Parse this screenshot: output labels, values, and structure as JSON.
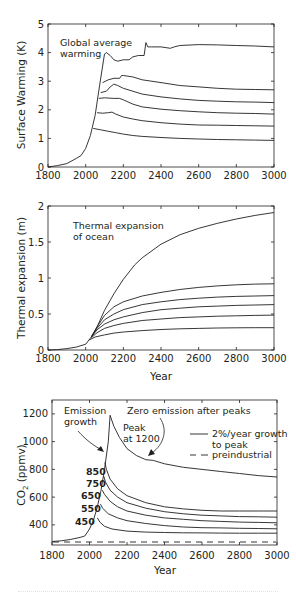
{
  "chart_data": [
    {
      "type": "line",
      "title": "",
      "annotation": [
        "Global average",
        "warming"
      ],
      "xlabel": "",
      "ylabel": "Surface Warming (K)",
      "xlim": [
        1800,
        3000
      ],
      "ylim": [
        0,
        5
      ],
      "xticks": [
        1800,
        2000,
        2200,
        2400,
        2600,
        2800,
        3000
      ],
      "yticks": [
        0,
        1,
        2,
        3,
        4,
        5
      ],
      "grid": false,
      "series": [
        {
          "name": "peak 1200",
          "x": [
            1800,
            1850,
            1900,
            1950,
            1975,
            2000,
            2025,
            2050,
            2075,
            2100,
            2110,
            2130,
            2150,
            2170,
            2200,
            2230,
            2250,
            2280,
            2310,
            2320,
            2330,
            2350,
            2400,
            2450,
            2470,
            2500,
            2600,
            2700,
            2800,
            2900,
            3000
          ],
          "y": [
            0,
            0.05,
            0.12,
            0.3,
            0.4,
            0.65,
            1.1,
            1.8,
            2.9,
            3.95,
            4.0,
            3.9,
            3.75,
            3.7,
            3.75,
            3.75,
            3.85,
            3.9,
            3.9,
            4.35,
            4.2,
            4.2,
            4.2,
            4.15,
            4.2,
            4.25,
            4.28,
            4.27,
            4.25,
            4.23,
            4.2
          ]
        },
        {
          "name": "peak 850",
          "x": [
            2090,
            2120,
            2150,
            2180,
            2190,
            2200,
            2250,
            2300,
            2400,
            2500,
            2600,
            2700,
            2800,
            2900,
            3000
          ],
          "y": [
            2.95,
            3.05,
            3.1,
            3.1,
            3.2,
            3.2,
            3.15,
            3.05,
            2.95,
            2.85,
            2.8,
            2.75,
            2.72,
            2.71,
            2.7
          ]
        },
        {
          "name": "peak 750",
          "x": [
            2080,
            2110,
            2130,
            2150,
            2170,
            2200,
            2250,
            2300,
            2400,
            2500,
            2600,
            2700,
            2800,
            2900,
            3000
          ],
          "y": [
            2.6,
            2.65,
            2.8,
            2.9,
            2.85,
            2.75,
            2.65,
            2.55,
            2.45,
            2.38,
            2.33,
            2.3,
            2.28,
            2.27,
            2.25
          ]
        },
        {
          "name": "peak 650",
          "x": [
            2070,
            2100,
            2150,
            2180,
            2200,
            2250,
            2300,
            2400,
            2500,
            2600,
            2700,
            2800,
            2900,
            3000
          ],
          "y": [
            2.4,
            2.42,
            2.4,
            2.4,
            2.35,
            2.2,
            2.1,
            2.02,
            1.97,
            1.93,
            1.9,
            1.88,
            1.87,
            1.85
          ]
        },
        {
          "name": "peak 550",
          "x": [
            2060,
            2090,
            2120,
            2140,
            2160,
            2200,
            2250,
            2300,
            2400,
            2500,
            2600,
            2700,
            2800,
            2900,
            3000
          ],
          "y": [
            1.9,
            1.88,
            1.9,
            1.92,
            1.85,
            1.75,
            1.68,
            1.62,
            1.55,
            1.5,
            1.47,
            1.46,
            1.45,
            1.44,
            1.43
          ]
        },
        {
          "name": "peak 450",
          "x": [
            2040,
            2080,
            2120,
            2160,
            2200,
            2250,
            2300,
            2400,
            2500,
            2600,
            2700,
            2800,
            2900,
            3000
          ],
          "y": [
            1.35,
            1.3,
            1.25,
            1.2,
            1.15,
            1.1,
            1.07,
            1.03,
            1.0,
            0.98,
            0.96,
            0.95,
            0.94,
            0.93
          ]
        }
      ]
    },
    {
      "type": "line",
      "title": "",
      "annotation": [
        "Thermal expansion",
        "of ocean"
      ],
      "xlabel": "Year",
      "ylabel": "Thermal expansion (m)",
      "xlim": [
        1800,
        3000
      ],
      "ylim": [
        0,
        2
      ],
      "xticks": [
        1800,
        2000,
        2200,
        2400,
        2600,
        2800,
        3000
      ],
      "yticks": [
        0,
        0.5,
        1,
        1.5,
        2
      ],
      "grid": false,
      "series": [
        {
          "name": "peak 1200",
          "x": [
            1800,
            1850,
            1900,
            1950,
            2000,
            2030,
            2060,
            2100,
            2150,
            2200,
            2260,
            2300,
            2400,
            2500,
            2600,
            2700,
            2800,
            2900,
            3000
          ],
          "y": [
            0,
            0.005,
            0.02,
            0.04,
            0.08,
            0.18,
            0.32,
            0.55,
            0.78,
            0.98,
            1.18,
            1.28,
            1.47,
            1.6,
            1.69,
            1.76,
            1.82,
            1.87,
            1.91
          ]
        },
        {
          "name": "peak 850",
          "x": [
            2030,
            2060,
            2100,
            2150,
            2200,
            2300,
            2400,
            2500,
            2600,
            2700,
            2800,
            2900,
            3000
          ],
          "y": [
            0.18,
            0.32,
            0.48,
            0.6,
            0.67,
            0.75,
            0.8,
            0.84,
            0.87,
            0.89,
            0.905,
            0.915,
            0.92
          ]
        },
        {
          "name": "peak 750",
          "x": [
            2030,
            2060,
            2100,
            2150,
            2200,
            2300,
            2400,
            2500,
            2600,
            2700,
            2800,
            2900,
            3000
          ],
          "y": [
            0.18,
            0.3,
            0.42,
            0.5,
            0.56,
            0.63,
            0.67,
            0.7,
            0.72,
            0.735,
            0.745,
            0.75,
            0.755
          ]
        },
        {
          "name": "peak 650",
          "x": [
            2030,
            2060,
            2100,
            2150,
            2200,
            2300,
            2400,
            2500,
            2600,
            2700,
            2800,
            2900,
            3000
          ],
          "y": [
            0.18,
            0.28,
            0.36,
            0.42,
            0.46,
            0.52,
            0.56,
            0.58,
            0.6,
            0.61,
            0.62,
            0.625,
            0.63
          ]
        },
        {
          "name": "peak 550",
          "x": [
            2030,
            2060,
            2100,
            2150,
            2200,
            2300,
            2400,
            2500,
            2600,
            2700,
            2800,
            2900,
            3000
          ],
          "y": [
            0.17,
            0.24,
            0.3,
            0.34,
            0.37,
            0.41,
            0.43,
            0.45,
            0.46,
            0.47,
            0.475,
            0.48,
            0.485
          ]
        },
        {
          "name": "peak 450",
          "x": [
            2020,
            2050,
            2100,
            2150,
            2200,
            2300,
            2400,
            2500,
            2600,
            2700,
            2800,
            2900,
            3000
          ],
          "y": [
            0.14,
            0.18,
            0.21,
            0.235,
            0.25,
            0.27,
            0.285,
            0.295,
            0.3,
            0.305,
            0.308,
            0.31,
            0.31
          ]
        }
      ]
    },
    {
      "type": "line",
      "title": "",
      "xlabel": "Year",
      "ylabel": "CO2 (ppmv)",
      "ylabel_main": "CO",
      "ylabel_sub": "2",
      "ylabel_tail": " (ppmv)",
      "xlim": [
        1800,
        3000
      ],
      "ylim": [
        255,
        1300
      ],
      "xticks": [
        1800,
        2000,
        2200,
        2400,
        2600,
        2800,
        3000
      ],
      "yticks": [
        400,
        600,
        800,
        1000,
        1200
      ],
      "grid": false,
      "legend": {
        "position": "upper right",
        "entries": [
          {
            "label": [
              "2%/year growth",
              "to peak"
            ],
            "style": "solid"
          },
          {
            "label": [
              "preindustrial"
            ],
            "style": "dashed"
          }
        ]
      },
      "annotations": {
        "emission_growth": [
          "Emission",
          "growth"
        ],
        "zero_emission": "Zero emission after peaks",
        "peak_1200": [
          "Peak",
          "at 1200"
        ],
        "peak_labels": [
          "850",
          "750",
          "650",
          "550",
          "450"
        ]
      },
      "preindustrial": 280,
      "series": [
        {
          "name": "peak 1200",
          "x": [
            1800,
            1850,
            1900,
            1950,
            1975,
            2000,
            2020,
            2040,
            2060,
            2080,
            2100,
            2110,
            2130,
            2160,
            2200,
            2250,
            2300,
            2340,
            2400,
            2500,
            2600,
            2700,
            2800,
            2900,
            3000
          ],
          "y": [
            280,
            285,
            295,
            310,
            320,
            370,
            430,
            520,
            640,
            800,
            1000,
            1190,
            1110,
            1030,
            950,
            900,
            870,
            865,
            840,
            815,
            800,
            785,
            770,
            755,
            745
          ]
        },
        {
          "name": "peak 850",
          "x": [
            2082,
            2090,
            2110,
            2150,
            2200,
            2300,
            2400,
            2500,
            2600,
            2700,
            2800,
            2900,
            3000
          ],
          "y": [
            850,
            800,
            730,
            660,
            610,
            560,
            530,
            515,
            505,
            500,
            500,
            500,
            500
          ]
        },
        {
          "name": "peak 750",
          "x": [
            2076,
            2085,
            2110,
            2150,
            2200,
            2300,
            2400,
            2500,
            2600,
            2700,
            2800,
            2900,
            3000
          ],
          "y": [
            750,
            710,
            650,
            600,
            560,
            520,
            495,
            480,
            470,
            465,
            460,
            458,
            455
          ]
        },
        {
          "name": "peak 650",
          "x": [
            2068,
            2080,
            2110,
            2150,
            2200,
            2300,
            2400,
            2500,
            2600,
            2700,
            2800,
            2900,
            3000
          ],
          "y": [
            650,
            620,
            570,
            530,
            500,
            470,
            450,
            440,
            430,
            425,
            420,
            418,
            415
          ]
        },
        {
          "name": "peak 550",
          "x": [
            2058,
            2070,
            2100,
            2150,
            2200,
            2300,
            2400,
            2500,
            2600,
            2700,
            2800,
            2900,
            3000
          ],
          "y": [
            550,
            520,
            480,
            450,
            430,
            410,
            395,
            385,
            380,
            378,
            375,
            374,
            372
          ]
        },
        {
          "name": "peak 450",
          "x": [
            2042,
            2055,
            2080,
            2120,
            2200,
            2300,
            2400,
            2500,
            2600,
            2700,
            2800,
            2900,
            3000
          ],
          "y": [
            450,
            420,
            390,
            370,
            355,
            348,
            345,
            343,
            342,
            341,
            340,
            340,
            340
          ]
        }
      ]
    }
  ]
}
